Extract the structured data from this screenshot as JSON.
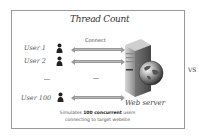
{
  "diagram": {
    "title": "Thread Count",
    "connect_label": "Connect",
    "users": [
      {
        "label": "User 1"
      },
      {
        "label": "User 2"
      },
      {
        "label": "User 100"
      }
    ],
    "ellipsis": "...",
    "server_label": "Web server",
    "caption": {
      "prefix": "Simulates ",
      "bold": "100 concurrent",
      "suffix": " users",
      "line2": "connecting to target website"
    },
    "vs_label": "VS"
  }
}
